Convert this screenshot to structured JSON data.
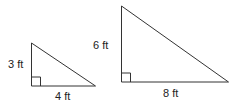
{
  "diagram": {
    "type": "similar-right-triangles",
    "triangles": [
      {
        "id": "small",
        "vertical_leg_label": "3 ft",
        "horizontal_leg_label": "4 ft",
        "vertical_leg": 3,
        "horizontal_leg": 4,
        "unit": "ft",
        "right_angle_marker": true
      },
      {
        "id": "large",
        "vertical_leg_label": "6 ft",
        "horizontal_leg_label": "8 ft",
        "vertical_leg": 6,
        "horizontal_leg": 8,
        "unit": "ft",
        "right_angle_marker": true
      }
    ],
    "stroke_color": "#333333",
    "background_color": "#ffffff"
  }
}
